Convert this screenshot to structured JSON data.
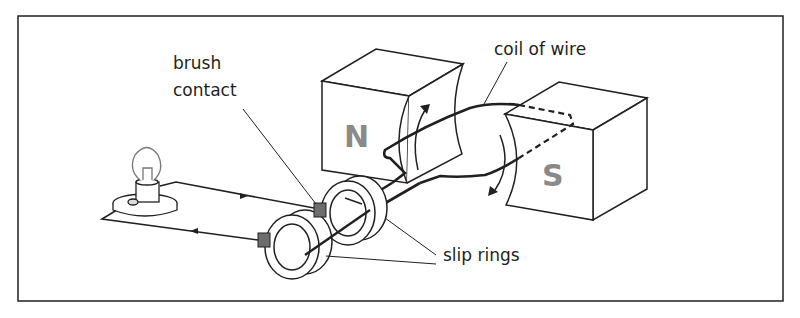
{
  "diagram": {
    "labels": {
      "brush_contact_line1": "brush",
      "brush_contact_line2": "contact",
      "coil": "coil of wire",
      "slip_rings": "slip rings"
    },
    "poles": {
      "north": "N",
      "south": "S"
    },
    "components": [
      "lamp",
      "circuit wires",
      "brush contacts",
      "slip rings",
      "coil of wire",
      "north magnet",
      "south magnet",
      "rotation arrows",
      "current direction arrows"
    ],
    "colors": {
      "line": "#231f20",
      "pole_text": "#8a8a8a",
      "brush_fill": "#6d6d6d",
      "background": "#ffffff"
    }
  }
}
